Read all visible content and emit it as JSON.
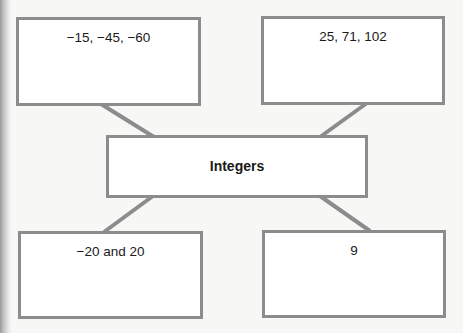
{
  "diagram": {
    "type": "concept-map",
    "center": {
      "label": "Integers"
    },
    "nodes": [
      {
        "id": "top-left",
        "label": "−15, −45, −60"
      },
      {
        "id": "top-right",
        "label": "25, 71, 102"
      },
      {
        "id": "bottom-left",
        "label": "−20 and 20"
      },
      {
        "id": "bottom-right",
        "label": "9"
      }
    ],
    "colors": {
      "border": "#8c8c8c",
      "connector": "#8c8c8c",
      "background": "#f7f7f5",
      "box_fill": "#ffffff",
      "text": "#1a1a1a"
    }
  }
}
